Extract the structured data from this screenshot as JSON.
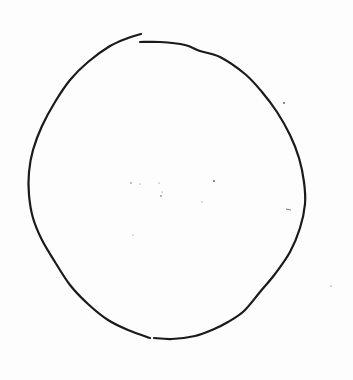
{
  "image": {
    "description": "Hand-drawn circle sketch on white paper",
    "background_color": "#fdfdfd",
    "stroke_color": "#1a1a1a",
    "stroke_width": 2.2
  },
  "sketch": {
    "subject": "circle",
    "strokes": [
      {
        "name": "main-arc-left",
        "points": [
          [
            141,
            34
          ],
          [
            128,
            38
          ],
          [
            110,
            46
          ],
          [
            88,
            62
          ],
          [
            70,
            80
          ],
          [
            55,
            102
          ],
          [
            42,
            126
          ],
          [
            33,
            150
          ],
          [
            29,
            172
          ],
          [
            29,
            195
          ],
          [
            33,
            218
          ],
          [
            42,
            240
          ],
          [
            55,
            262
          ],
          [
            70,
            285
          ],
          [
            88,
            304
          ],
          [
            108,
            320
          ],
          [
            128,
            330
          ],
          [
            150,
            338
          ]
        ]
      },
      {
        "name": "main-arc-right",
        "points": [
          [
            140,
            42
          ],
          [
            160,
            42
          ],
          [
            185,
            45
          ],
          [
            200,
            51
          ],
          [
            220,
            57
          ],
          [
            245,
            74
          ],
          [
            262,
            92
          ],
          [
            277,
            112
          ],
          [
            290,
            135
          ],
          [
            299,
            158
          ],
          [
            304,
            182
          ],
          [
            305,
            204
          ],
          [
            300,
            228
          ],
          [
            290,
            252
          ],
          [
            275,
            274
          ],
          [
            260,
            292
          ],
          [
            244,
            311
          ],
          [
            228,
            322
          ],
          [
            212,
            330
          ],
          [
            195,
            336
          ],
          [
            172,
            339
          ],
          [
            154,
            338
          ]
        ]
      }
    ],
    "gaps": [
      {
        "location": "top",
        "x": 140,
        "y": 38
      },
      {
        "location": "bottom",
        "x": 152,
        "y": 338
      }
    ],
    "speckles": [
      {
        "x": 284,
        "y": 103,
        "r": 0.9
      },
      {
        "x": 131,
        "y": 183,
        "r": 0.7
      },
      {
        "x": 140,
        "y": 184,
        "r": 0.5
      },
      {
        "x": 159,
        "y": 183,
        "r": 0.5
      },
      {
        "x": 161,
        "y": 196,
        "r": 0.8
      },
      {
        "x": 162,
        "y": 192,
        "r": 0.5
      },
      {
        "x": 202,
        "y": 202,
        "r": 0.5
      },
      {
        "x": 214,
        "y": 181,
        "r": 0.9
      },
      {
        "x": 133,
        "y": 235,
        "r": 0.5
      },
      {
        "x": 331,
        "y": 286,
        "r": 0.6
      }
    ],
    "dashes": [
      {
        "x1": 286,
        "y1": 209,
        "x2": 291,
        "y2": 210
      }
    ]
  }
}
